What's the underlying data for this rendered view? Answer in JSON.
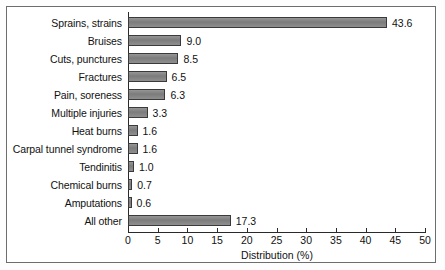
{
  "chart_data": {
    "type": "bar",
    "orientation": "horizontal",
    "title": "",
    "xlabel": "Distribution (%)",
    "ylabel": "",
    "xlim": [
      0,
      50
    ],
    "xticks": [
      0,
      5,
      10,
      15,
      20,
      25,
      30,
      35,
      40,
      45,
      50
    ],
    "grid": false,
    "legend": null,
    "bar_color": "#828282",
    "bar_edge_color": "#3a3a3a",
    "categories": [
      "Sprains, strains",
      "Bruises",
      "Cuts, punctures",
      "Fractures",
      "Pain, soreness",
      "Multiple injuries",
      "Heat burns",
      "Carpal tunnel syndrome",
      "Tendinitis",
      "Chemical burns",
      "Amputations",
      "All other"
    ],
    "values": [
      43.6,
      9.0,
      8.5,
      6.5,
      6.3,
      3.3,
      1.6,
      1.6,
      1.0,
      0.7,
      0.6,
      17.3
    ],
    "value_labels": [
      "43.6",
      "9.0",
      "8.5",
      "6.5",
      "6.3",
      "3.3",
      "1.6",
      "1.6",
      "1.0",
      "0.7",
      "0.6",
      "17.3"
    ],
    "tick_labels": [
      "0",
      "5",
      "10",
      "15",
      "20",
      "25",
      "30",
      "35",
      "40",
      "45",
      "50"
    ]
  }
}
